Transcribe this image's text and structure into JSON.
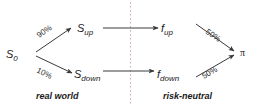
{
  "diagram": {
    "colors": {
      "background": "#ffffff",
      "edge": "#3a3a3a",
      "text": "#1a1a1a",
      "divider": "#c9a9a9"
    },
    "panels": [
      {
        "id": "left",
        "caption": "real world"
      },
      {
        "id": "right",
        "caption": "risk-neutral"
      }
    ],
    "nodes": {
      "root": {
        "base": "S",
        "sub": "0",
        "full": "S0"
      },
      "up": {
        "base": "S",
        "sub": "up",
        "full": "Sup"
      },
      "down": {
        "base": "S",
        "sub": "down",
        "full": "Sdown"
      },
      "payoff_up": {
        "base": "f",
        "sub": "up",
        "full": "fup"
      },
      "payoff_down": {
        "base": "f",
        "sub": "down",
        "full": "fdown"
      },
      "price": {
        "base": "π",
        "sub": "",
        "full": "π"
      }
    },
    "edges": [
      {
        "id": "root-to-up",
        "label": "90%"
      },
      {
        "id": "root-to-down",
        "label": "10%"
      },
      {
        "id": "up-to-payoff-up",
        "label": ""
      },
      {
        "id": "down-to-payoff-down",
        "label": ""
      },
      {
        "id": "payoff-up-to-price",
        "label": "50%"
      },
      {
        "id": "payoff-down-to-price",
        "label": "50%"
      }
    ]
  }
}
